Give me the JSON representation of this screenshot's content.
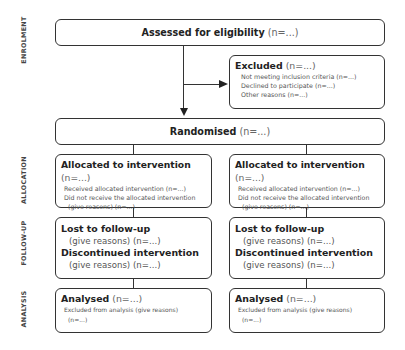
{
  "side_labels": {
    "enrolment": "ENROLMENT",
    "allocation": "ALLOCATION",
    "follow_up": "FOLLOW-UP",
    "analysis": "ANALYSIS"
  },
  "assessed": {
    "title": "Assessed for eligibility",
    "n": "(n=...)"
  },
  "excluded": {
    "title": "Excluded",
    "n": "(n=...)",
    "items": [
      "Not meeting inclusion criteria (n=...)",
      "Declined to participate (n=...)",
      "Other reasons (n=...)"
    ]
  },
  "randomised": {
    "title": "Randomised",
    "n": "(n=...)"
  },
  "arms": [
    {
      "allocation": {
        "title": "Allocated to intervention",
        "n": "(n=...)",
        "received": "Received allocated intervention (n=...)",
        "not_received": "Did not receive the allocated intervention",
        "not_received_reason": "(give reasons) (n=...)"
      },
      "follow_up": {
        "lost_title": "Lost to follow-up",
        "lost_detail": "(give reasons) (n=...)",
        "discontinued_title": "Discontinued intervention",
        "discontinued_detail": "(give reasons) (n=...)"
      },
      "analysis": {
        "title": "Analysed",
        "n": "(n=...)",
        "excluded": "Excluded from analysis (give reasons)",
        "excluded_n": "(n=...)"
      }
    },
    {
      "allocation": {
        "title": "Allocated to intervention",
        "n": "(n=...)",
        "received": "Received allocated intervention (n=...)",
        "not_received": "Did not receive the allocated intervention",
        "not_received_reason": "(give reasons) (n=...)"
      },
      "follow_up": {
        "lost_title": "Lost to follow-up",
        "lost_detail": "(give reasons) (n=...)",
        "discontinued_title": "Discontinued intervention",
        "discontinued_detail": "(give reasons) (n=...)"
      },
      "analysis": {
        "title": "Analysed",
        "n": "(n=...)",
        "excluded": "Excluded from analysis (give reasons)",
        "excluded_n": "(n=...)"
      }
    }
  ]
}
